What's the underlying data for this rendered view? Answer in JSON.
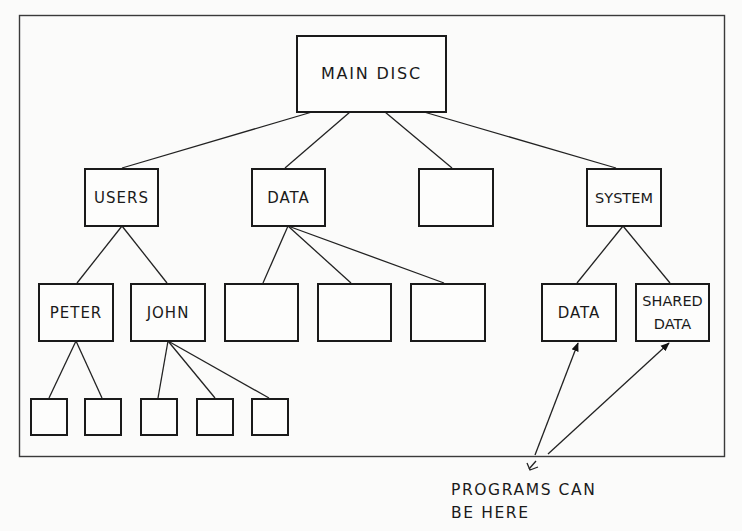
{
  "diagram": {
    "type": "tree",
    "title": "",
    "root": {
      "id": "main-disc",
      "label": "MAIN DISC",
      "children": [
        {
          "id": "users",
          "label": "USERS",
          "children": [
            {
              "id": "peter",
              "label": "PETER",
              "children": [
                {
                  "id": "peter-child-1",
                  "label": ""
                },
                {
                  "id": "peter-child-2",
                  "label": ""
                }
              ]
            },
            {
              "id": "john",
              "label": "JOHN",
              "children": [
                {
                  "id": "john-child-1",
                  "label": ""
                },
                {
                  "id": "john-child-2",
                  "label": ""
                },
                {
                  "id": "john-child-3",
                  "label": ""
                }
              ]
            }
          ]
        },
        {
          "id": "data",
          "label": "DATA",
          "children": [
            {
              "id": "data-child-1",
              "label": ""
            },
            {
              "id": "data-child-2",
              "label": ""
            },
            {
              "id": "data-child-3",
              "label": ""
            }
          ]
        },
        {
          "id": "unnamed",
          "label": ""
        },
        {
          "id": "system",
          "label": "SYSTEM",
          "children": [
            {
              "id": "system-data",
              "label": "DATA"
            },
            {
              "id": "shared-data",
              "label": "SHARED DATA",
              "lines": [
                "SHARED",
                "DATA"
              ]
            }
          ]
        }
      ]
    },
    "annotation": {
      "lines": [
        "PROGRAMS CAN",
        "BE HERE"
      ],
      "points_to": [
        "system-data",
        "shared-data"
      ]
    }
  },
  "labels": {
    "main_disc": "MAIN DISC",
    "users": "USERS",
    "data": "DATA",
    "system": "SYSTEM",
    "peter": "PETER",
    "john": "JOHN",
    "system_data": "DATA",
    "shared_data_line1": "SHARED",
    "shared_data_line2": "DATA",
    "caption_line1": "PROGRAMS CAN",
    "caption_line2": "BE HERE"
  }
}
